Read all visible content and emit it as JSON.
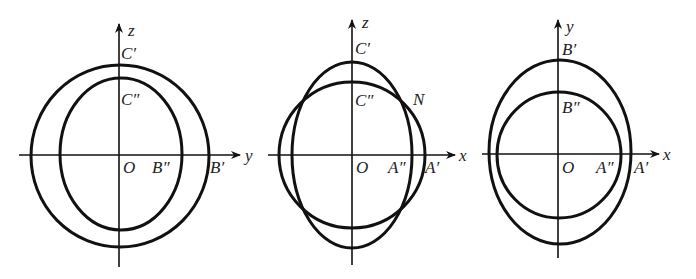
{
  "figures": [
    {
      "name": "yz-projection",
      "axes": {
        "horizontal": "y",
        "vertical": "z"
      },
      "labels": {
        "vertical_axis": "z",
        "horizontal_axis": "y",
        "origin": "O",
        "outer_top": "C′",
        "inner_top": "C″",
        "inner_right": "B″",
        "outer_right": "B′"
      }
    },
    {
      "name": "xz-projection",
      "axes": {
        "horizontal": "x",
        "vertical": "z"
      },
      "labels": {
        "vertical_axis": "z",
        "horizontal_axis": "x",
        "origin": "O",
        "outer_top": "C′",
        "inner_top": "C″",
        "intersection": "N",
        "inner_right": "A″",
        "outer_right": "A′"
      }
    },
    {
      "name": "xy-projection",
      "axes": {
        "horizontal": "x",
        "vertical": "y"
      },
      "labels": {
        "vertical_axis": "y",
        "horizontal_axis": "x",
        "origin": "O",
        "outer_top": "B′",
        "inner_top": "B″",
        "inner_right": "A″",
        "outer_right": "A′"
      }
    }
  ]
}
